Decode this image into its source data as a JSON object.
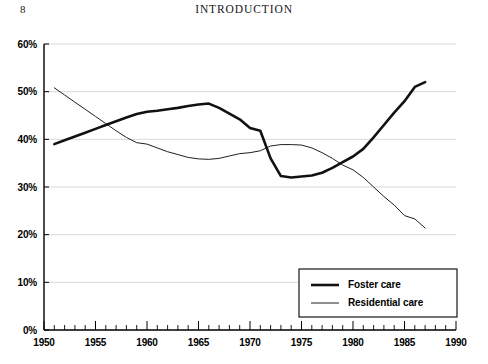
{
  "page": {
    "number": "8",
    "running_head": "INTRODUCTION"
  },
  "chart_data": {
    "type": "line",
    "title": "",
    "xlabel": "",
    "ylabel": "",
    "xlim": [
      1950,
      1990
    ],
    "ylim": [
      0,
      60
    ],
    "grid": true,
    "legend_position": "bottom-right",
    "x_tick_labels": [
      "1950",
      "1955",
      "1960",
      "1965",
      "1970",
      "1975",
      "1980",
      "1985",
      "1990"
    ],
    "x_tick_values": [
      1950,
      1955,
      1960,
      1965,
      1970,
      1975,
      1980,
      1985,
      1990
    ],
    "x_minor_tick_interval": 1,
    "y_tick_labels": [
      "0%",
      "10%",
      "20%",
      "30%",
      "40%",
      "50%",
      "60%"
    ],
    "y_tick_values": [
      0,
      10,
      20,
      30,
      40,
      50,
      60
    ],
    "series": [
      {
        "name": "Foster care",
        "color": "#111111",
        "line_width": "thick",
        "x": [
          1951,
          1952,
          1953,
          1954,
          1955,
          1956,
          1957,
          1958,
          1959,
          1960,
          1961,
          1962,
          1963,
          1964,
          1965,
          1966,
          1967,
          1968,
          1969,
          1970,
          1971,
          1972,
          1973,
          1974,
          1975,
          1976,
          1977,
          1978,
          1979,
          1980,
          1981,
          1982,
          1983,
          1984,
          1985,
          1986,
          1987
        ],
        "values": [
          39.0,
          39.8,
          40.6,
          41.4,
          42.2,
          43.0,
          43.8,
          44.6,
          45.3,
          45.8,
          46.0,
          46.3,
          46.6,
          47.0,
          47.3,
          47.5,
          46.6,
          45.4,
          44.2,
          42.4,
          41.8,
          36.0,
          32.3,
          32.0,
          32.2,
          32.4,
          33.0,
          34.0,
          35.2,
          36.4,
          38.0,
          40.4,
          43.0,
          45.6,
          48.0,
          51.0,
          52.0
        ]
      },
      {
        "name": "Residential care",
        "color": "#202020",
        "line_width": "thin",
        "x": [
          1951,
          1952,
          1953,
          1954,
          1955,
          1956,
          1957,
          1958,
          1959,
          1960,
          1961,
          1962,
          1963,
          1964,
          1965,
          1966,
          1967,
          1968,
          1969,
          1970,
          1971,
          1972,
          1973,
          1974,
          1975,
          1976,
          1977,
          1978,
          1979,
          1980,
          1981,
          1982,
          1983,
          1984,
          1985,
          1986,
          1987
        ],
        "values": [
          50.8,
          49.3,
          47.8,
          46.3,
          44.8,
          43.3,
          41.8,
          40.4,
          39.3,
          39.0,
          38.2,
          37.4,
          36.8,
          36.2,
          35.9,
          35.8,
          36.0,
          36.5,
          37.0,
          37.2,
          37.6,
          38.6,
          38.9,
          38.9,
          38.8,
          38.2,
          37.2,
          36.0,
          34.6,
          33.6,
          32.0,
          30.0,
          28.0,
          26.2,
          24.0,
          23.3,
          21.4
        ]
      }
    ]
  },
  "legend": {
    "items": [
      {
        "label": "Foster care"
      },
      {
        "label": "Residential care"
      }
    ]
  }
}
